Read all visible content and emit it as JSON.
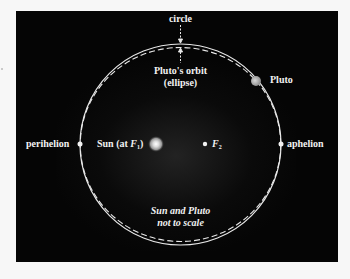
{
  "diagram": {
    "labels": {
      "circle": "circle",
      "orbit_line1": "Pluto's orbit",
      "orbit_line2": "(ellipse)",
      "pluto": "Pluto",
      "perihelion": "perihelion",
      "sun_prefix": "Sun (at ",
      "sun_focus": "F",
      "sun_focus_sub": "1",
      "sun_suffix": ")",
      "f2": "F",
      "f2_sub": "2",
      "aphelion": "aphelion",
      "note_line1": "Sun and Pluto",
      "note_line2": "not to scale"
    },
    "colors": {
      "background": "#050505",
      "line": "#e8e8e8",
      "sun": "#d9d9d9",
      "pluto": "#b5b5b5",
      "text": "#f2f2f2"
    },
    "geometry": {
      "circle": {
        "cx": 164.5,
        "cy": 133.5,
        "r": 100.5
      },
      "ellipse": {
        "cx": 164.5,
        "cy": 133.5,
        "rx": 100.5,
        "ry": 97.5
      },
      "sun": {
        "x": 140,
        "y": 133
      },
      "f2": {
        "x": 189,
        "y": 133
      },
      "perihelion": {
        "x": 64,
        "y": 133
      },
      "aphelion": {
        "x": 265,
        "y": 133
      },
      "pluto": {
        "x": 240,
        "y": 70
      }
    }
  }
}
